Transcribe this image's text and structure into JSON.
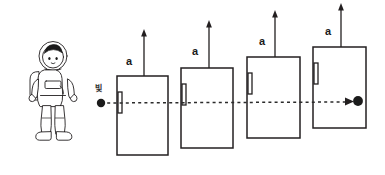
{
  "diagram": {
    "background_color": "#ffffff",
    "stroke_color": "#231f20",
    "dash_color": "#2b2b2b",
    "observer": {
      "name": "astronaut",
      "icon": "astronaut-figure",
      "x": 27,
      "y": 40,
      "width": 52,
      "height": 100
    },
    "light_ray": {
      "label": "빛",
      "label_x": 96,
      "label_y": 86,
      "start_dot": {
        "x": 101,
        "y": 103,
        "r": 4.2
      },
      "end_dot": {
        "x": 357,
        "y": 101,
        "r": 4.8
      },
      "line_y": 103,
      "line_x_start": 101,
      "line_x_end": 360,
      "arrow_tip_x": 352,
      "arrow_tip_y": 101
    },
    "boxes": [
      {
        "id": "box-1",
        "label": "a",
        "label_x": 126,
        "label_y": 57,
        "x": 117,
        "y": 76,
        "width": 51,
        "height": 79,
        "arrow": {
          "x": 144,
          "y_top": 31,
          "y_bottom": 76
        },
        "handle": {
          "x": 118,
          "y": 92,
          "width": 4,
          "height": 21
        }
      },
      {
        "id": "box-2",
        "label": "a",
        "label_x": 192,
        "label_y": 47,
        "x": 181,
        "y": 68,
        "width": 52,
        "height": 80,
        "arrow": {
          "x": 209,
          "y_top": 22,
          "y_bottom": 68
        },
        "handle": {
          "x": 182,
          "y": 84,
          "width": 4,
          "height": 21
        }
      },
      {
        "id": "box-3",
        "label": "a",
        "label_x": 259,
        "label_y": 37,
        "x": 247,
        "y": 57,
        "width": 53,
        "height": 81,
        "arrow": {
          "x": 275,
          "y_top": 12,
          "y_bottom": 57
        },
        "handle": {
          "x": 248,
          "y": 73,
          "width": 4,
          "height": 21
        }
      },
      {
        "id": "box-4",
        "label": "a",
        "label_x": 325,
        "label_y": 27,
        "x": 313,
        "y": 47,
        "width": 53,
        "height": 81,
        "arrow": {
          "x": 341,
          "y_top": 5,
          "y_bottom": 47
        },
        "handle": {
          "x": 314,
          "y": 63,
          "width": 4,
          "height": 21
        }
      }
    ]
  }
}
